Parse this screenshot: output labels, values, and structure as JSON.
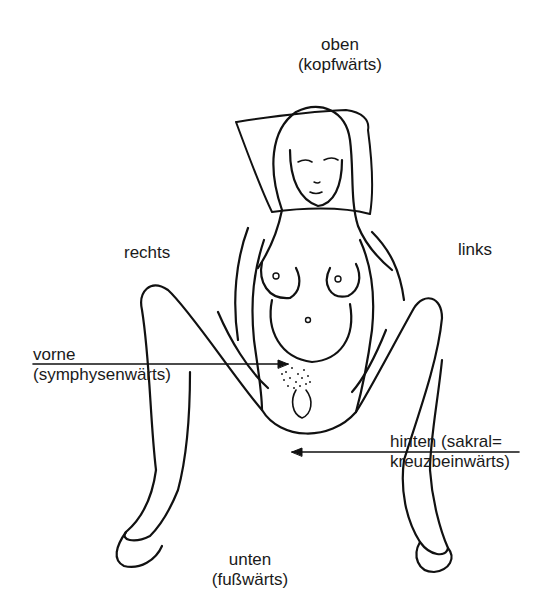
{
  "diagram": {
    "type": "anatomical-orientation",
    "labels": {
      "top": {
        "line1": "oben",
        "line2": "(kopfwärts)"
      },
      "right_side": {
        "line1": "rechts"
      },
      "left_side": {
        "line1": "links"
      },
      "front": {
        "line1": "vorne",
        "line2": "(symphysenwärts)"
      },
      "back": {
        "line1": "hinten (sakral=",
        "line2": "kreuzbeinwärts)"
      },
      "bottom": {
        "line1": "unten",
        "line2": "(fußwärts)"
      }
    },
    "arrows": [
      {
        "name": "front-arrow",
        "from": "vorne label",
        "to": "symphysis",
        "direction": "right"
      },
      {
        "name": "back-arrow",
        "from": "hinten label",
        "to": "sacrum",
        "direction": "left"
      }
    ],
    "colors": {
      "ink": "#111111",
      "background": "#ffffff"
    }
  }
}
